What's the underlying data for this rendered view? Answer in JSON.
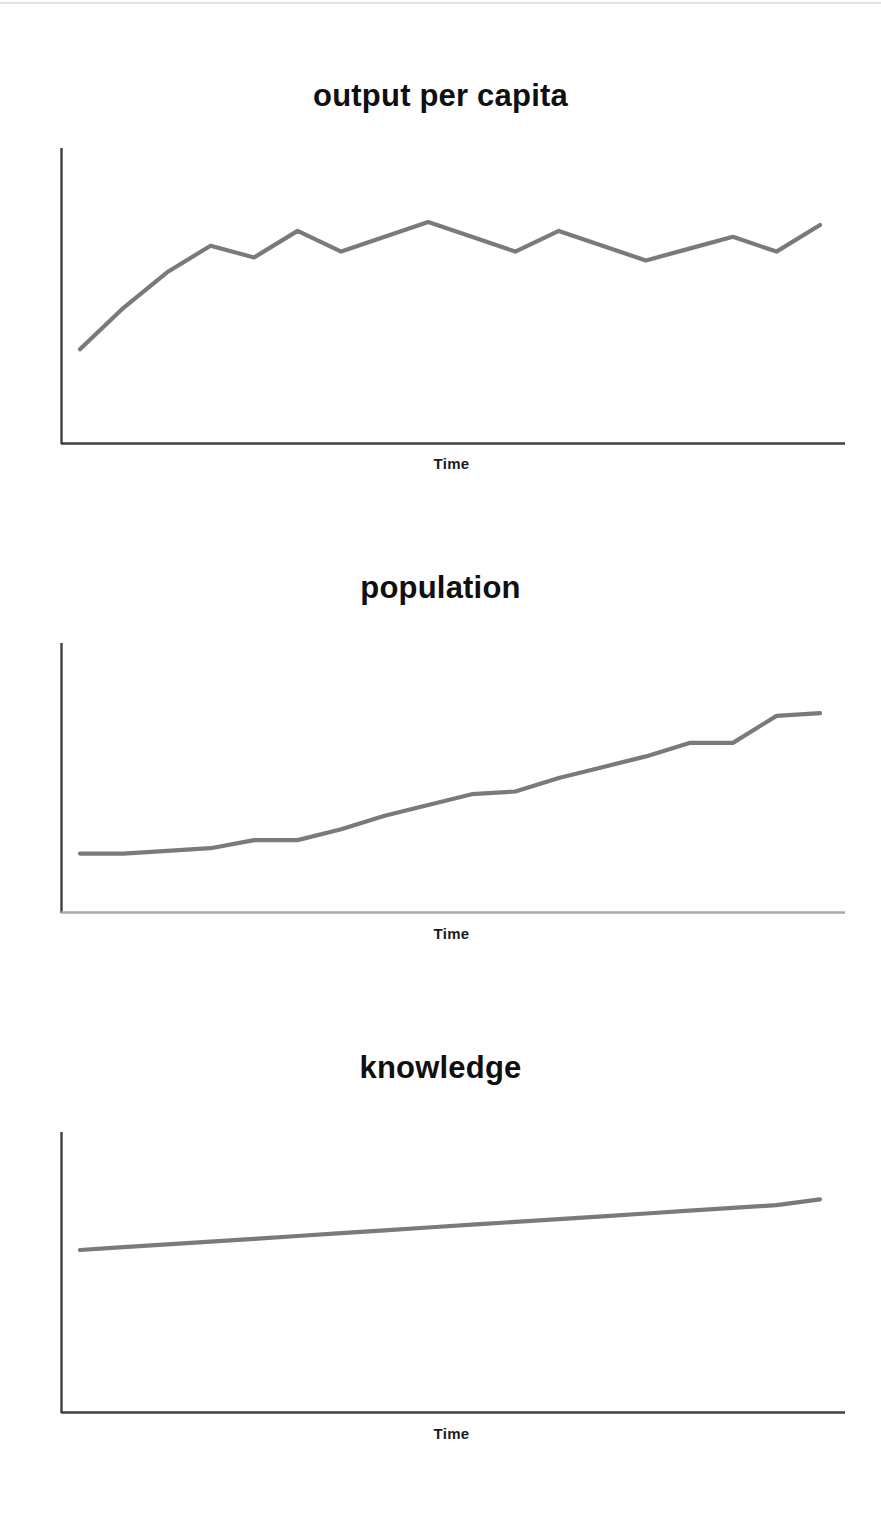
{
  "page": {
    "background_color": "#ffffff",
    "top_rule_color": "#e2e2e4",
    "line_color": "#7a7a7a",
    "axis_color_dark": "#3f3f3f",
    "axis_color_light": "#a8a8a8",
    "title_color": "#101010",
    "label_color": "#1b1b1b"
  },
  "panels": [
    {
      "id": "output",
      "title": "output per capita",
      "xlabel": "Time"
    },
    {
      "id": "population",
      "title": "population",
      "xlabel": "Time"
    },
    {
      "id": "knowledge",
      "title": "knowledge",
      "xlabel": "Time"
    }
  ],
  "chart_data": [
    {
      "type": "line",
      "title": "output per capita",
      "xlabel": "Time",
      "ylabel": "",
      "grid": false,
      "legend": "none",
      "axis_ranges": {
        "x": [
          0,
          20
        ],
        "y": [
          0,
          100
        ]
      },
      "axes": {
        "x_axis": "solid dark line",
        "y_axis": "solid dark line",
        "ticks": "none",
        "tick_labels": "none"
      },
      "description": "Noisy but roughly flat-after-rise series: rises steeply at first then fluctuates around a slowly rising level",
      "x": [
        0,
        1,
        2,
        3,
        4,
        5,
        6,
        7,
        8,
        9,
        10,
        11,
        12,
        13,
        14,
        15,
        16,
        17
      ],
      "values": [
        32,
        46,
        58,
        67,
        63,
        72,
        65,
        70,
        75,
        70,
        65,
        72,
        67,
        62,
        66,
        70,
        65,
        74
      ],
      "series": [
        {
          "name": "output per capita",
          "values": [
            32,
            46,
            58,
            67,
            63,
            72,
            65,
            70,
            75,
            70,
            65,
            72,
            67,
            62,
            66,
            70,
            65,
            74
          ]
        }
      ]
    },
    {
      "type": "line",
      "title": "population",
      "xlabel": "Time",
      "ylabel": "",
      "grid": false,
      "legend": "none",
      "axis_ranges": {
        "x": [
          0,
          20
        ],
        "y": [
          0,
          100
        ]
      },
      "axes": {
        "x_axis": "solid light-grey line",
        "y_axis": "solid dark line",
        "ticks": "none",
        "tick_labels": "none"
      },
      "description": "Slowly accelerating, monotonically increasing series with small plateaus",
      "x": [
        0,
        1,
        2,
        3,
        4,
        5,
        6,
        7,
        8,
        9,
        10,
        11,
        12,
        13,
        14,
        15,
        16,
        17
      ],
      "values": [
        22,
        22,
        23,
        24,
        27,
        27,
        31,
        36,
        40,
        44,
        45,
        50,
        54,
        58,
        63,
        63,
        73,
        74
      ],
      "series": [
        {
          "name": "population",
          "values": [
            22,
            22,
            23,
            24,
            27,
            27,
            31,
            36,
            40,
            44,
            45,
            50,
            54,
            58,
            63,
            63,
            73,
            74
          ]
        }
      ]
    },
    {
      "type": "line",
      "title": "knowledge",
      "xlabel": "Time",
      "ylabel": "",
      "grid": false,
      "legend": "none",
      "axis_ranges": {
        "x": [
          0,
          20
        ],
        "y": [
          0,
          100
        ]
      },
      "axes": {
        "x_axis": "solid dark line",
        "y_axis": "solid dark line",
        "ticks": "none",
        "tick_labels": "none"
      },
      "description": "Nearly straight, gently upward-sloping line",
      "x": [
        0,
        1,
        2,
        3,
        4,
        5,
        6,
        7,
        8,
        9,
        10,
        11,
        12,
        13,
        14,
        15,
        16,
        17
      ],
      "values": [
        58,
        59,
        60,
        61,
        62,
        63,
        64,
        65,
        66,
        67,
        68,
        69,
        70,
        71,
        72,
        73,
        74,
        76
      ],
      "series": [
        {
          "name": "knowledge",
          "values": [
            58,
            59,
            60,
            61,
            62,
            63,
            64,
            65,
            66,
            67,
            68,
            69,
            70,
            71,
            72,
            73,
            74,
            76
          ]
        }
      ]
    }
  ]
}
